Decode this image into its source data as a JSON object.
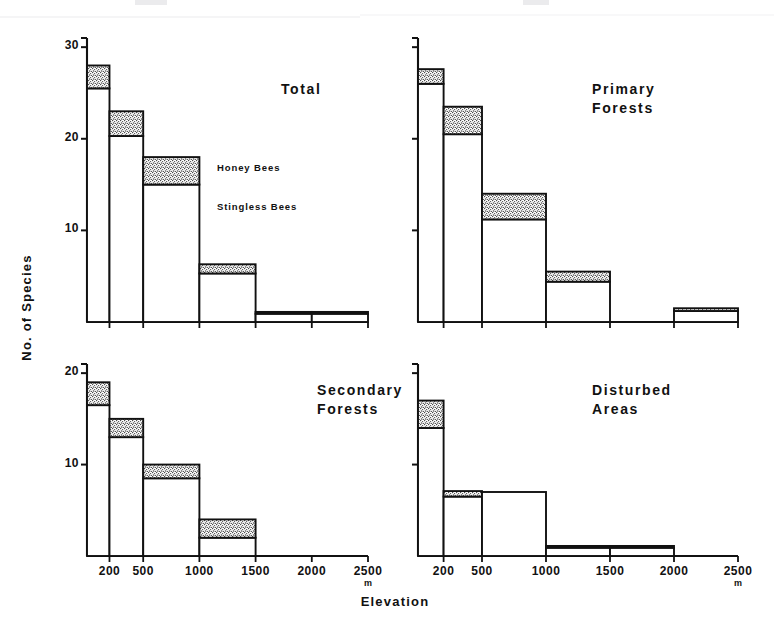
{
  "figure": {
    "xlabel": "Elevation",
    "ylabel": "No. of Species",
    "unit": "m",
    "legend": {
      "honey": "Honey Bees",
      "stingless": "Stingless Bees"
    }
  },
  "chart_data": {
    "type": "bar",
    "title": "",
    "xlabel": "Elevation",
    "ylabel": "No. of Species",
    "x_unit": "m",
    "grid": false,
    "legend_position": "inside-top-left-panel",
    "legend_entries": [
      "Honey Bees",
      "Stingless Bees"
    ],
    "stacked": true,
    "bin_edges": [
      0,
      200,
      500,
      1000,
      1500,
      2000,
      2500
    ],
    "bin_tick_labels": [
      "200",
      "500",
      "1000",
      "1500",
      "2000",
      "2500"
    ],
    "ylim": [
      0,
      31
    ],
    "yticks_left_top": [
      10,
      20,
      30
    ],
    "yticks_left_bottom": [
      10,
      20
    ],
    "colors": {
      "honey": "#d9d9d9",
      "stingless": "#ffffff",
      "outline": "#111111"
    },
    "panels": [
      {
        "name": "Total",
        "label": "Total",
        "position": "top-left",
        "ymax": 31,
        "yticks": [
          10,
          20,
          30
        ],
        "ytick_labels": [
          "10",
          "20",
          "30"
        ],
        "categories": [
          "0-200",
          "200-500",
          "500-1000",
          "1000-1500",
          "1500-2000",
          "2000-2500"
        ],
        "series": [
          {
            "name": "Stingless Bees",
            "values": [
              25.5,
              20.3,
              15,
              5.3,
              0.9,
              0.9
            ]
          },
          {
            "name": "Honey Bees",
            "values": [
              2.5,
              2.7,
              3,
              1,
              0.2,
              0.2
            ]
          }
        ],
        "totals": [
          28,
          23,
          18,
          6.3,
          1.1,
          1.1
        ]
      },
      {
        "name": "Primary Forests",
        "label": "Primary\nForests",
        "position": "top-right",
        "ymax": 31,
        "yticks": [
          10,
          20,
          30
        ],
        "ytick_labels": [
          "",
          "",
          ""
        ],
        "categories": [
          "0-200",
          "200-500",
          "500-1000",
          "1000-1500",
          "1500-2000",
          "2000-2500"
        ],
        "series": [
          {
            "name": "Stingless Bees",
            "values": [
              26,
              20.5,
              11.2,
              4.4,
              0,
              1.2
            ]
          },
          {
            "name": "Honey Bees",
            "values": [
              1.6,
              3,
              2.8,
              1.1,
              0,
              0.3
            ]
          }
        ],
        "totals": [
          27.6,
          23.5,
          14,
          5.5,
          0,
          1.5
        ]
      },
      {
        "name": "Secondary Forests",
        "label": "Secondary\nForests",
        "position": "bottom-left",
        "ymax": 21,
        "yticks": [
          10,
          20
        ],
        "ytick_labels": [
          "10",
          "20"
        ],
        "categories": [
          "0-200",
          "200-500",
          "500-1000",
          "1000-1500",
          "1500-2000",
          "2000-2500"
        ],
        "series": [
          {
            "name": "Stingless Bees",
            "values": [
              16.5,
              13,
              8.5,
              2,
              0,
              0
            ]
          },
          {
            "name": "Honey Bees",
            "values": [
              2.5,
              2,
              1.5,
              2,
              0,
              0
            ]
          }
        ],
        "totals": [
          19,
          15,
          10,
          4,
          0,
          0
        ]
      },
      {
        "name": "Disturbed Areas",
        "label": "Disturbed\nAreas",
        "position": "bottom-right",
        "ymax": 21,
        "yticks": [
          10,
          20
        ],
        "ytick_labels": [
          "",
          ""
        ],
        "categories": [
          "0-200",
          "200-500",
          "500-1000",
          "1000-1500",
          "1500-2000",
          "2000-2500"
        ],
        "series": [
          {
            "name": "Stingless Bees",
            "values": [
              14,
              6.5,
              7,
              0.9,
              0.9,
              0
            ]
          },
          {
            "name": "Honey Bees",
            "values": [
              3,
              0.6,
              0,
              0.2,
              0.2,
              0
            ]
          }
        ],
        "totals": [
          17,
          7.1,
          7,
          1.1,
          1.1,
          0
        ]
      }
    ]
  }
}
